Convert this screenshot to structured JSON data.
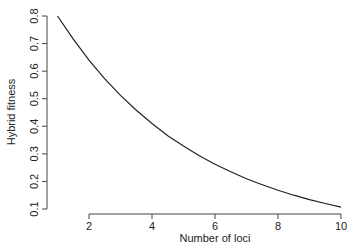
{
  "chart_data": {
    "type": "line",
    "title": "",
    "xlabel": "Number of loci",
    "ylabel": "Hybrid fitness",
    "xlim": [
      1,
      10
    ],
    "ylim": [
      0.1,
      0.8
    ],
    "x_ticks": [
      2,
      4,
      6,
      8,
      10
    ],
    "x_tick_labels": [
      "2",
      "4",
      "6",
      "8",
      "10"
    ],
    "y_ticks": [
      0.1,
      0.2,
      0.3,
      0.4,
      0.5,
      0.6,
      0.7,
      0.8
    ],
    "y_tick_labels": [
      "0.1",
      "0.2",
      "0.3",
      "0.4",
      "0.5",
      "0.6",
      "0.7",
      "0.8"
    ],
    "grid": false,
    "legend": null,
    "series": [
      {
        "name": "Hybrid fitness",
        "color": "#222222",
        "x": [
          1,
          1.5,
          2,
          2.5,
          3,
          3.5,
          4,
          4.5,
          5,
          5.5,
          6,
          6.5,
          7,
          7.5,
          8,
          8.5,
          9,
          9.5,
          10
        ],
        "y": [
          0.8,
          0.716,
          0.64,
          0.572,
          0.512,
          0.458,
          0.41,
          0.366,
          0.328,
          0.293,
          0.262,
          0.235,
          0.21,
          0.188,
          0.168,
          0.15,
          0.134,
          0.12,
          0.107
        ]
      }
    ]
  }
}
